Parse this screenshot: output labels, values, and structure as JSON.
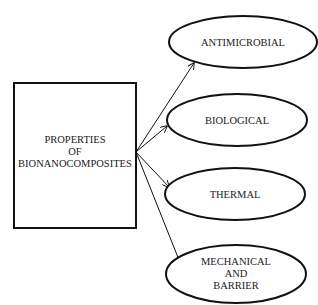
{
  "diagram": {
    "source": {
      "lines": [
        "PROPERTIES",
        "OF",
        "BIONANOCOMPOSITES"
      ]
    },
    "targets": [
      {
        "id": "antimicrobial",
        "lines": [
          "ANTIMICROBIAL"
        ]
      },
      {
        "id": "biological",
        "lines": [
          "BIOLOGICAL"
        ]
      },
      {
        "id": "thermal",
        "lines": [
          "THERMAL"
        ]
      },
      {
        "id": "mechanical-barrier",
        "lines": [
          "MECHANICAL",
          "AND",
          "BARRIER"
        ]
      }
    ],
    "colors": {
      "stroke": "#111111",
      "text": "#222222",
      "background": "#ffffff"
    }
  }
}
